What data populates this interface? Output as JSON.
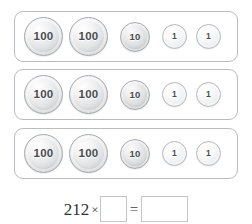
{
  "worksheet": {
    "title": "Place value coin groups multiplication",
    "groups": [
      {
        "name": "group-1",
        "total": 212,
        "coins": [
          {
            "value": "100",
            "size": "large"
          },
          {
            "value": "100",
            "size": "large"
          },
          {
            "value": "10",
            "size": "medium"
          },
          {
            "value": "1",
            "size": "small"
          },
          {
            "value": "1",
            "size": "small"
          }
        ]
      },
      {
        "name": "group-2",
        "total": 212,
        "coins": [
          {
            "value": "100",
            "size": "large"
          },
          {
            "value": "100",
            "size": "large"
          },
          {
            "value": "10",
            "size": "medium"
          },
          {
            "value": "1",
            "size": "small"
          },
          {
            "value": "1",
            "size": "small"
          }
        ]
      },
      {
        "name": "group-3",
        "total": 212,
        "coins": [
          {
            "value": "100",
            "size": "large"
          },
          {
            "value": "100",
            "size": "large"
          },
          {
            "value": "10",
            "size": "medium"
          },
          {
            "value": "1",
            "size": "small"
          },
          {
            "value": "1",
            "size": "small"
          }
        ]
      }
    ],
    "equation": {
      "multiplicand": "212",
      "times_symbol": "×",
      "multiplier_value": "",
      "multiplier_placeholder": "",
      "equals_symbol": "=",
      "product_value": "",
      "product_placeholder": ""
    }
  },
  "colors": {
    "page_background": "#ffffff",
    "group_border": "#b9bcc0",
    "coin_text": "#4a4d51",
    "coin_rim_large": "#a7aaae",
    "coin_rim_medium": "#a9acb0",
    "coin_rim_small": "#b6b9bd",
    "equation_text": "#333333",
    "answer_box_border": "#c3c5c8"
  }
}
